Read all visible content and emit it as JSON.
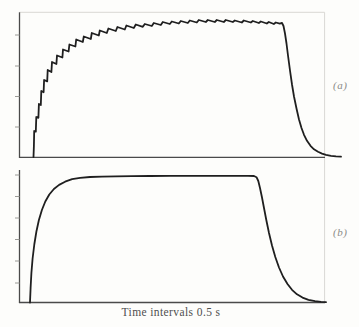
{
  "figure": {
    "xlabel": "Time intervals 0.5 s",
    "background": "#fdfdfb",
    "curve_color": "#1f1f1f",
    "axis_color": "#4a4a4a",
    "tick_color": "#9a9a96",
    "border_color": "#d9d8d4",
    "xlabel_color": "#4f4f4f",
    "panel_label_color": "#8b8b87",
    "border_points_px": [
      [
        19.5,
        12.3
      ],
      [
        324.6,
        12.3
      ],
      [
        324.6,
        302.5
      ]
    ]
  },
  "panels": [
    {
      "label": "(a)"
    },
    {
      "label": "(b)"
    }
  ],
  "chart_data": [
    {
      "type": "line",
      "panel": "(a)",
      "title": "",
      "xlabel": "Time intervals 0.5 s",
      "ylabel": "",
      "legend": "none",
      "grid": false,
      "description": "Noisy trace: stepped rapid rise, long rippled plateau, then smooth exponential decay back to baseline.",
      "axis": {
        "x_px": 19.5,
        "top_px": 12.3,
        "baseline_px": 157.3,
        "right_px": 325,
        "tick_len": 4.5,
        "tick_y_px": [
          35,
          66,
          96.5,
          127
        ]
      },
      "points_px": [
        [
          33.5,
          157
        ],
        [
          33.9,
          146
        ],
        [
          34.2,
          131
        ],
        [
          35.8,
          131.6
        ],
        [
          36.3,
          117
        ],
        [
          38.4,
          117.8
        ],
        [
          38.9,
          104
        ],
        [
          40.8,
          105
        ],
        [
          41.3,
          91
        ],
        [
          43.6,
          92.2
        ],
        [
          44.1,
          80
        ],
        [
          47.2,
          81.4
        ],
        [
          47.7,
          70
        ],
        [
          51.4,
          72
        ],
        [
          52,
          62
        ],
        [
          56.4,
          64
        ],
        [
          57,
          55.5
        ],
        [
          62.4,
          57.5
        ],
        [
          63,
          49.5
        ],
        [
          68.6,
          51.5
        ],
        [
          69.4,
          44.5
        ],
        [
          75.4,
          46.5
        ],
        [
          76.2,
          39.5
        ],
        [
          82.8,
          42
        ],
        [
          83.8,
          36.5
        ],
        [
          90.8,
          39
        ],
        [
          91.8,
          33
        ],
        [
          98.8,
          35.5
        ],
        [
          99.8,
          30.5
        ],
        [
          106.8,
          33
        ],
        [
          108.4,
          28.5
        ],
        [
          115.8,
          31
        ],
        [
          117.4,
          27
        ],
        [
          124.8,
          29.5
        ],
        [
          126.4,
          25.5
        ],
        [
          133.8,
          28
        ],
        [
          135.8,
          24.5
        ],
        [
          142.8,
          26.8
        ],
        [
          144.8,
          24
        ],
        [
          151.8,
          26
        ],
        [
          153.8,
          23
        ],
        [
          160.8,
          25
        ],
        [
          162.8,
          22
        ],
        [
          169.8,
          24
        ],
        [
          171.8,
          21.5
        ],
        [
          178.8,
          23.5
        ],
        [
          180.8,
          21
        ],
        [
          187.8,
          23
        ],
        [
          189.8,
          20.5
        ],
        [
          196.8,
          22.5
        ],
        [
          198.8,
          20
        ],
        [
          205.8,
          22
        ],
        [
          207.8,
          20
        ],
        [
          214.8,
          22
        ],
        [
          216.8,
          20
        ],
        [
          223.8,
          22
        ],
        [
          225.8,
          20
        ],
        [
          232.8,
          22
        ],
        [
          234.8,
          20.5
        ],
        [
          241.8,
          22.5
        ],
        [
          243.8,
          20.5
        ],
        [
          250.8,
          22.5
        ],
        [
          252.8,
          21
        ],
        [
          258.8,
          23
        ],
        [
          260.8,
          21.5
        ],
        [
          266.8,
          23.5
        ],
        [
          268.8,
          22
        ],
        [
          273.8,
          24
        ],
        [
          275.8,
          22.5
        ],
        [
          279.8,
          23.6
        ],
        [
          282,
          22.8
        ],
        [
          283.5,
          26
        ],
        [
          285,
          33.5
        ],
        [
          286.5,
          43.5
        ],
        [
          288,
          55.5
        ],
        [
          290,
          70.5
        ],
        [
          292,
          84.5
        ],
        [
          294,
          96.5
        ],
        [
          296.5,
          108.5
        ],
        [
          299,
          119.5
        ],
        [
          301.5,
          128
        ],
        [
          304,
          134.8
        ],
        [
          307,
          140.8
        ],
        [
          310.5,
          145.8
        ],
        [
          314,
          149.3
        ],
        [
          318,
          151.8
        ],
        [
          322,
          153.6
        ],
        [
          326,
          154.9
        ],
        [
          331,
          155.8
        ],
        [
          336,
          156.3
        ],
        [
          341,
          156.6
        ]
      ]
    },
    {
      "type": "line",
      "panel": "(b)",
      "title": "",
      "xlabel": "Time intervals 0.5 s",
      "ylabel": "",
      "legend": "none",
      "grid": false,
      "description": "Smooth trace: saturating exponential rise to a flat plateau, abrupt shutoff corner, then exponential decay to baseline.",
      "axis": {
        "x_px": 19.5,
        "top_px": 170,
        "baseline_px": 302.5,
        "right_px": 325,
        "tick_len": 4.5,
        "tick_y_px": [
          175,
          196.5,
          218,
          239.5,
          261,
          283
        ]
      },
      "points_px": [
        [
          30,
          302.5
        ],
        [
          30.6,
          288
        ],
        [
          31.4,
          273
        ],
        [
          32.6,
          258.5
        ],
        [
          34.3,
          244.5
        ],
        [
          36.4,
          231.5
        ],
        [
          38.9,
          220
        ],
        [
          41.9,
          210
        ],
        [
          45.3,
          201.5
        ],
        [
          49.3,
          194.5
        ],
        [
          53.9,
          189
        ],
        [
          59.1,
          184.9
        ],
        [
          65.1,
          181.7
        ],
        [
          72.1,
          179.2
        ],
        [
          80.1,
          177.9
        ],
        [
          90,
          177
        ],
        [
          102,
          176.6
        ],
        [
          116,
          176.3
        ],
        [
          132,
          176.1
        ],
        [
          150,
          176
        ],
        [
          170,
          175.9
        ],
        [
          192,
          175.9
        ],
        [
          214,
          175.8
        ],
        [
          234,
          175.8
        ],
        [
          248,
          175.8
        ],
        [
          254,
          176
        ],
        [
          256.5,
          177.2
        ],
        [
          258.3,
          181
        ],
        [
          260,
          188
        ],
        [
          262,
          197.5
        ],
        [
          264,
          208
        ],
        [
          266.3,
          220
        ],
        [
          269,
          233
        ],
        [
          272,
          245.5
        ],
        [
          275.3,
          257
        ],
        [
          279,
          267.5
        ],
        [
          283,
          276.5
        ],
        [
          287.5,
          284
        ],
        [
          292,
          289.8
        ],
        [
          297,
          294.3
        ],
        [
          302.5,
          297.6
        ],
        [
          308.5,
          299.8
        ],
        [
          315,
          301.2
        ],
        [
          321,
          301.9
        ],
        [
          326,
          302.2
        ]
      ]
    }
  ]
}
